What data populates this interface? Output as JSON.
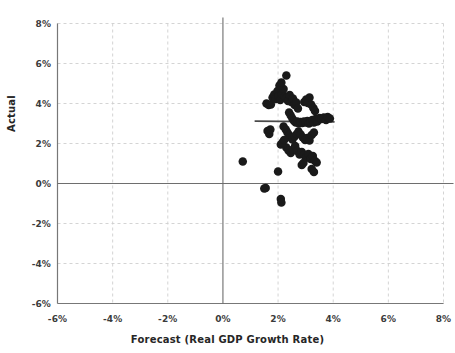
{
  "chart_data": {
    "type": "scatter",
    "title": "",
    "xlabel": "Forecast (Real GDP Growth Rate)",
    "ylabel": "Actual",
    "xlim": [
      -6,
      8
    ],
    "ylim": [
      -6,
      8
    ],
    "xticks": [
      "-6%",
      "-4%",
      "-2%",
      "0%",
      "2%",
      "4%",
      "6%",
      "8%"
    ],
    "xtick_values": [
      -6,
      -4,
      -2,
      0,
      2,
      4,
      6,
      8
    ],
    "yticks": [
      "8%",
      "6%",
      "4%",
      "2%",
      "0%",
      "-2%",
      "-4%",
      "-6%"
    ],
    "ytick_values": [
      8,
      6,
      4,
      2,
      0,
      -2,
      -4,
      -6
    ],
    "grid": true,
    "legend": "none",
    "marker_color": "#1a1a1a",
    "marker_size": 8.5,
    "gridline_color": "#cfcfcf",
    "axis_color": "#777777",
    "zero_line_color": "#6e6e6e",
    "trend_line_color": "#4a4a4a",
    "trend_line": {
      "x_start": 1.15,
      "x_end": 4.05,
      "y_start": 3.12,
      "y_end": 3.08
    },
    "series": [
      {
        "name": "Forecast vs Actual",
        "points": [
          [
            0.72,
            1.1
          ],
          [
            1.5,
            -0.25
          ],
          [
            1.55,
            -0.22
          ],
          [
            2.0,
            0.6
          ],
          [
            2.1,
            -0.78
          ],
          [
            2.12,
            -0.95
          ],
          [
            1.62,
            2.62
          ],
          [
            1.68,
            2.48
          ],
          [
            1.72,
            2.7
          ],
          [
            1.58,
            4.0
          ],
          [
            1.66,
            3.92
          ],
          [
            1.74,
            3.95
          ],
          [
            1.8,
            4.3
          ],
          [
            1.86,
            4.45
          ],
          [
            1.92,
            4.22
          ],
          [
            1.98,
            4.62
          ],
          [
            2.02,
            4.38
          ],
          [
            2.08,
            4.18
          ],
          [
            2.14,
            4.48
          ],
          [
            2.2,
            4.72
          ],
          [
            2.05,
            4.9
          ],
          [
            2.12,
            5.05
          ],
          [
            2.3,
            5.4
          ],
          [
            2.24,
            4.35
          ],
          [
            2.3,
            4.28
          ],
          [
            2.36,
            4.12
          ],
          [
            2.42,
            4.42
          ],
          [
            2.48,
            4.08
          ],
          [
            2.54,
            4.25
          ],
          [
            2.6,
            3.92
          ],
          [
            2.66,
            4.05
          ],
          [
            2.72,
            3.75
          ],
          [
            2.4,
            3.55
          ],
          [
            2.46,
            3.4
          ],
          [
            2.52,
            3.25
          ],
          [
            2.58,
            3.12
          ],
          [
            2.64,
            3.05
          ],
          [
            2.7,
            3.1
          ],
          [
            2.76,
            3.0
          ],
          [
            2.82,
            3.08
          ],
          [
            2.88,
            3.02
          ],
          [
            2.94,
            3.1
          ],
          [
            3.0,
            3.05
          ],
          [
            3.06,
            3.12
          ],
          [
            3.12,
            3.0
          ],
          [
            3.18,
            3.08
          ],
          [
            3.24,
            3.18
          ],
          [
            3.3,
            3.05
          ],
          [
            3.36,
            3.22
          ],
          [
            3.42,
            3.1
          ],
          [
            3.5,
            3.28
          ],
          [
            3.58,
            3.22
          ],
          [
            3.66,
            3.3
          ],
          [
            3.74,
            3.18
          ],
          [
            3.8,
            3.32
          ],
          [
            3.88,
            3.25
          ],
          [
            2.95,
            4.08
          ],
          [
            3.02,
            4.2
          ],
          [
            3.08,
            4.02
          ],
          [
            3.14,
            4.3
          ],
          [
            3.2,
            3.95
          ],
          [
            3.28,
            3.78
          ],
          [
            3.34,
            3.62
          ],
          [
            2.2,
            2.85
          ],
          [
            2.28,
            2.7
          ],
          [
            2.34,
            2.55
          ],
          [
            2.4,
            2.42
          ],
          [
            2.46,
            2.3
          ],
          [
            2.52,
            2.2
          ],
          [
            2.6,
            2.35
          ],
          [
            2.68,
            2.48
          ],
          [
            2.74,
            2.6
          ],
          [
            2.82,
            2.45
          ],
          [
            2.9,
            2.3
          ],
          [
            2.98,
            2.18
          ],
          [
            3.06,
            2.28
          ],
          [
            3.14,
            2.15
          ],
          [
            3.22,
            2.42
          ],
          [
            3.3,
            2.55
          ],
          [
            2.3,
            1.8
          ],
          [
            2.38,
            1.65
          ],
          [
            2.46,
            1.52
          ],
          [
            2.54,
            1.7
          ],
          [
            2.62,
            1.88
          ],
          [
            2.7,
            1.62
          ],
          [
            2.78,
            1.45
          ],
          [
            2.86,
            1.58
          ],
          [
            2.94,
            1.42
          ],
          [
            3.02,
            1.3
          ],
          [
            3.1,
            1.48
          ],
          [
            3.18,
            1.22
          ],
          [
            3.26,
            1.38
          ],
          [
            3.34,
            1.12
          ],
          [
            3.4,
            1.05
          ],
          [
            3.22,
            0.72
          ],
          [
            3.3,
            0.58
          ],
          [
            2.86,
            0.92
          ],
          [
            2.92,
            1.02
          ],
          [
            2.1,
            1.95
          ],
          [
            2.16,
            2.05
          ],
          [
            2.22,
            2.18
          ]
        ]
      }
    ]
  }
}
